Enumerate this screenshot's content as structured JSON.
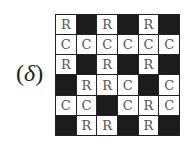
{
  "label": {
    "open": "(",
    "symbol": "δ",
    "close": ")"
  },
  "grid": {
    "rows": 6,
    "cols": 6,
    "cells": [
      [
        {
          "fill": "w",
          "text": "R"
        },
        {
          "fill": "b",
          "text": ""
        },
        {
          "fill": "w",
          "text": "R"
        },
        {
          "fill": "b",
          "text": ""
        },
        {
          "fill": "w",
          "text": "R"
        },
        {
          "fill": "b",
          "text": ""
        }
      ],
      [
        {
          "fill": "w",
          "text": "C"
        },
        {
          "fill": "w",
          "text": "C"
        },
        {
          "fill": "w",
          "text": "C"
        },
        {
          "fill": "w",
          "text": "C"
        },
        {
          "fill": "w",
          "text": "C"
        },
        {
          "fill": "w",
          "text": "C"
        }
      ],
      [
        {
          "fill": "w",
          "text": "R"
        },
        {
          "fill": "b",
          "text": ""
        },
        {
          "fill": "w",
          "text": "R"
        },
        {
          "fill": "b",
          "text": ""
        },
        {
          "fill": "w",
          "text": "R"
        },
        {
          "fill": "b",
          "text": ""
        }
      ],
      [
        {
          "fill": "b",
          "text": ""
        },
        {
          "fill": "w",
          "text": "R"
        },
        {
          "fill": "w",
          "text": "R"
        },
        {
          "fill": "w",
          "text": "C"
        },
        {
          "fill": "b",
          "text": ""
        },
        {
          "fill": "w",
          "text": "C"
        }
      ],
      [
        {
          "fill": "w",
          "text": "C"
        },
        {
          "fill": "w",
          "text": "C"
        },
        {
          "fill": "b",
          "text": ""
        },
        {
          "fill": "w",
          "text": "C"
        },
        {
          "fill": "w",
          "text": "R"
        },
        {
          "fill": "w",
          "text": "C"
        }
      ],
      [
        {
          "fill": "b",
          "text": ""
        },
        {
          "fill": "w",
          "text": "R"
        },
        {
          "fill": "w",
          "text": "R"
        },
        {
          "fill": "b",
          "text": ""
        },
        {
          "fill": "w",
          "text": "R"
        },
        {
          "fill": "b",
          "text": ""
        }
      ]
    ]
  }
}
